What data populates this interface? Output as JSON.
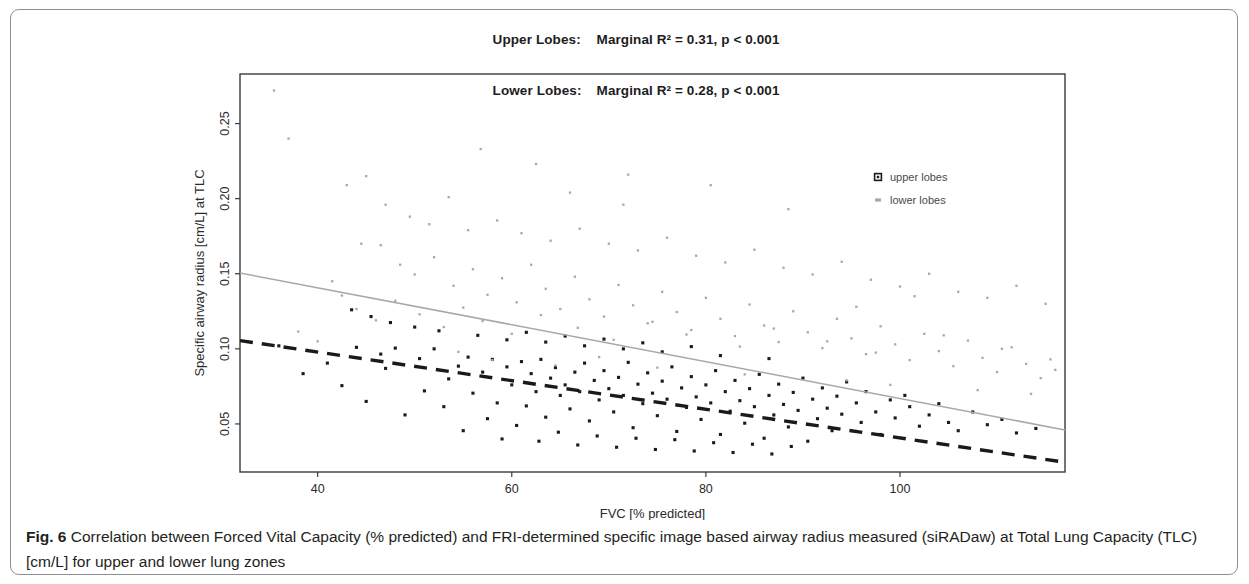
{
  "figure": {
    "label": "Fig. 6",
    "caption": " Correlation between Forced Vital Capacity (% predicted) and FRI-determined specific image based airway radius measured (siRADaw) at Total Lung Capacity (TLC) [cm/L] for upper and lower lung zones"
  },
  "title": {
    "line1_label": "Upper Lobes:",
    "line1_value": "Marginal R² = 0.31, p < 0.001",
    "line2_label": "Lower Lobes:",
    "line2_value": "Marginal R² = 0.28, p < 0.001"
  },
  "colors": {
    "upper_lobes": "#1a1a1a",
    "lower_lobes": "#a8a8a8",
    "axis": "#3a3a3a",
    "frame": "#8b8f93"
  },
  "chart_data": {
    "type": "scatter",
    "xlabel": "FVC [% predicted]",
    "ylabel": "Specific airway radius [cm/L] at TLC",
    "xlim": [
      32,
      117
    ],
    "ylim": [
      0.018,
      0.283
    ],
    "xticks": [
      40,
      60,
      80,
      100
    ],
    "yticks": [
      0.05,
      0.1,
      0.15,
      0.2,
      0.25
    ],
    "ytick_labels": [
      "0.05",
      "0.10",
      "0.15",
      "0.20",
      "0.25"
    ],
    "xtick_labels": [
      "40",
      "60",
      "80",
      "100"
    ],
    "grid": false,
    "legend_position": "top-right",
    "series": [
      {
        "name": "upper lobes",
        "marker": "square-open",
        "color": "#1a1a1a",
        "trendline": {
          "style": "dashed",
          "color": "#1a1a1a",
          "x_start": 32,
          "y_start": 0.1055,
          "x_end": 117,
          "y_end": 0.0245
        },
        "points": [
          [
            46.5,
            0.0965
          ],
          [
            48.0,
            0.1005
          ],
          [
            50.5,
            0.0935
          ],
          [
            52.0,
            0.1
          ],
          [
            53.5,
            0.08
          ],
          [
            54.5,
            0.0885
          ],
          [
            55.5,
            0.0945
          ],
          [
            56.0,
            0.0705
          ],
          [
            57.0,
            0.0845
          ],
          [
            58.0,
            0.093
          ],
          [
            58.5,
            0.064
          ],
          [
            59.5,
            0.088
          ],
          [
            60.0,
            0.076
          ],
          [
            61.0,
            0.0915
          ],
          [
            61.5,
            0.062
          ],
          [
            62.0,
            0.0835
          ],
          [
            62.5,
            0.0715
          ],
          [
            63.0,
            0.093
          ],
          [
            63.5,
            0.0545
          ],
          [
            64.0,
            0.0805
          ],
          [
            64.5,
            0.0875
          ],
          [
            65.0,
            0.069
          ],
          [
            65.5,
            0.076
          ],
          [
            66.0,
            0.06
          ],
          [
            66.5,
            0.0845
          ],
          [
            67.0,
            0.0715
          ],
          [
            67.5,
            0.0905
          ],
          [
            68.0,
            0.052
          ],
          [
            68.5,
            0.079
          ],
          [
            69.0,
            0.066
          ],
          [
            69.5,
            0.0855
          ],
          [
            70.0,
            0.0735
          ],
          [
            70.5,
            0.058
          ],
          [
            71.0,
            0.081
          ],
          [
            71.5,
            0.069
          ],
          [
            72.0,
            0.091
          ],
          [
            72.5,
            0.0475
          ],
          [
            73.0,
            0.0765
          ],
          [
            73.5,
            0.0635
          ],
          [
            74.0,
            0.084
          ],
          [
            74.5,
            0.0705
          ],
          [
            75.0,
            0.0555
          ],
          [
            75.5,
            0.0785
          ],
          [
            76.0,
            0.0665
          ],
          [
            76.5,
            0.088
          ],
          [
            77.0,
            0.045
          ],
          [
            77.5,
            0.074
          ],
          [
            78.0,
            0.061
          ],
          [
            78.5,
            0.0815
          ],
          [
            79.0,
            0.068
          ],
          [
            79.5,
            0.053
          ],
          [
            80.0,
            0.076
          ],
          [
            80.5,
            0.064
          ],
          [
            81.0,
            0.0855
          ],
          [
            81.5,
            0.043
          ],
          [
            82.0,
            0.0715
          ],
          [
            82.5,
            0.0585
          ],
          [
            83.0,
            0.079
          ],
          [
            83.5,
            0.0655
          ],
          [
            84.0,
            0.0505
          ],
          [
            84.5,
            0.0735
          ],
          [
            85.0,
            0.0615
          ],
          [
            85.5,
            0.083
          ],
          [
            86.0,
            0.0405
          ],
          [
            86.5,
            0.069
          ],
          [
            87.0,
            0.056
          ],
          [
            87.5,
            0.0765
          ],
          [
            88.0,
            0.063
          ],
          [
            88.5,
            0.048
          ],
          [
            89.0,
            0.071
          ],
          [
            89.5,
            0.059
          ],
          [
            90.0,
            0.0805
          ],
          [
            90.5,
            0.0385
          ],
          [
            91.0,
            0.0665
          ],
          [
            91.5,
            0.0535
          ],
          [
            92.0,
            0.074
          ],
          [
            92.5,
            0.0605
          ],
          [
            93.0,
            0.0455
          ],
          [
            93.5,
            0.0685
          ],
          [
            94.0,
            0.0565
          ],
          [
            94.5,
            0.078
          ],
          [
            95.5,
            0.064
          ],
          [
            96.0,
            0.051
          ],
          [
            96.5,
            0.0715
          ],
          [
            97.5,
            0.058
          ],
          [
            98.0,
            0.043
          ],
          [
            99.0,
            0.066
          ],
          [
            99.5,
            0.054
          ],
          [
            100.5,
            0.069
          ],
          [
            101.0,
            0.0615
          ],
          [
            102.0,
            0.0485
          ],
          [
            103.0,
            0.056
          ],
          [
            104.0,
            0.0635
          ],
          [
            105.0,
            0.051
          ],
          [
            106.0,
            0.0455
          ],
          [
            107.5,
            0.058
          ],
          [
            109.0,
            0.0495
          ],
          [
            110.5,
            0.053
          ],
          [
            112.0,
            0.044
          ],
          [
            114.0,
            0.047
          ],
          [
            36.0,
            0.102
          ],
          [
            38.5,
            0.0835
          ],
          [
            41.0,
            0.0905
          ],
          [
            42.5,
            0.0755
          ],
          [
            44.0,
            0.101
          ],
          [
            45.0,
            0.065
          ],
          [
            47.0,
            0.087
          ],
          [
            49.0,
            0.056
          ],
          [
            51.0,
            0.072
          ],
          [
            53.0,
            0.0615
          ],
          [
            55.0,
            0.0455
          ],
          [
            57.5,
            0.0535
          ],
          [
            59.0,
            0.04
          ],
          [
            60.5,
            0.049
          ],
          [
            62.8,
            0.0385
          ],
          [
            64.8,
            0.0445
          ],
          [
            66.8,
            0.036
          ],
          [
            68.8,
            0.042
          ],
          [
            70.8,
            0.0345
          ],
          [
            72.8,
            0.0405
          ],
          [
            74.8,
            0.033
          ],
          [
            76.8,
            0.0395
          ],
          [
            78.8,
            0.032
          ],
          [
            80.8,
            0.0375
          ],
          [
            82.8,
            0.031
          ],
          [
            84.8,
            0.0365
          ],
          [
            86.8,
            0.03
          ],
          [
            88.8,
            0.035
          ],
          [
            59.5,
            0.106
          ],
          [
            61.5,
            0.111
          ],
          [
            63.5,
            0.1045
          ],
          [
            65.5,
            0.1085
          ],
          [
            67.5,
            0.102
          ],
          [
            69.5,
            0.1065
          ],
          [
            71.5,
            0.1
          ],
          [
            73.5,
            0.104
          ],
          [
            75.5,
            0.098
          ],
          [
            78.5,
            0.1015
          ],
          [
            81.5,
            0.0955
          ],
          [
            86.5,
            0.0935
          ],
          [
            43.5,
            0.126
          ],
          [
            45.5,
            0.1215
          ],
          [
            47.5,
            0.1175
          ],
          [
            50.0,
            0.1145
          ],
          [
            52.5,
            0.112
          ],
          [
            56.5,
            0.109
          ]
        ]
      },
      {
        "name": "lower lobes",
        "marker": "square-small",
        "color": "#a8a8a8",
        "trendline": {
          "style": "solid",
          "color": "#a8a8a8",
          "x_start": 32,
          "y_start": 0.1505,
          "x_end": 117,
          "y_end": 0.046
        },
        "points": [
          [
            35.5,
            0.272
          ],
          [
            37.0,
            0.24
          ],
          [
            44.5,
            0.17
          ],
          [
            46.5,
            0.169
          ],
          [
            48.5,
            0.156
          ],
          [
            50.0,
            0.1495
          ],
          [
            52.0,
            0.161
          ],
          [
            54.0,
            0.142
          ],
          [
            56.0,
            0.153
          ],
          [
            57.5,
            0.136
          ],
          [
            59.0,
            0.147
          ],
          [
            60.5,
            0.131
          ],
          [
            62.0,
            0.156
          ],
          [
            63.5,
            0.14
          ],
          [
            65.0,
            0.1265
          ],
          [
            66.5,
            0.148
          ],
          [
            68.0,
            0.133
          ],
          [
            69.5,
            0.1215
          ],
          [
            71.0,
            0.1425
          ],
          [
            72.5,
            0.129
          ],
          [
            74.0,
            0.117
          ],
          [
            75.5,
            0.138
          ],
          [
            77.0,
            0.1245
          ],
          [
            78.5,
            0.1125
          ],
          [
            80.0,
            0.134
          ],
          [
            81.5,
            0.12
          ],
          [
            83.0,
            0.1085
          ],
          [
            84.5,
            0.1295
          ],
          [
            86.0,
            0.1155
          ],
          [
            87.5,
            0.1045
          ],
          [
            89.0,
            0.125
          ],
          [
            90.5,
            0.111
          ],
          [
            92.0,
            0.1005
          ],
          [
            93.5,
            0.12
          ],
          [
            95.0,
            0.107
          ],
          [
            96.5,
            0.0965
          ],
          [
            98.0,
            0.115
          ],
          [
            99.5,
            0.103
          ],
          [
            101.0,
            0.0925
          ],
          [
            102.5,
            0.11
          ],
          [
            104.0,
            0.0985
          ],
          [
            105.5,
            0.0885
          ],
          [
            107.0,
            0.1055
          ],
          [
            108.5,
            0.094
          ],
          [
            110.0,
            0.0845
          ],
          [
            111.5,
            0.101
          ],
          [
            113.0,
            0.09
          ],
          [
            114.5,
            0.0805
          ],
          [
            116.0,
            0.086
          ],
          [
            47.0,
            0.196
          ],
          [
            49.5,
            0.188
          ],
          [
            51.5,
            0.183
          ],
          [
            55.5,
            0.179
          ],
          [
            58.5,
            0.1855
          ],
          [
            61.0,
            0.177
          ],
          [
            64.0,
            0.172
          ],
          [
            67.0,
            0.18
          ],
          [
            70.0,
            0.17
          ],
          [
            73.0,
            0.1655
          ],
          [
            76.0,
            0.174
          ],
          [
            79.0,
            0.162
          ],
          [
            82.0,
            0.1575
          ],
          [
            85.0,
            0.166
          ],
          [
            88.0,
            0.154
          ],
          [
            91.0,
            0.1495
          ],
          [
            94.0,
            0.158
          ],
          [
            97.0,
            0.146
          ],
          [
            100.0,
            0.1415
          ],
          [
            103.0,
            0.15
          ],
          [
            106.0,
            0.138
          ],
          [
            109.0,
            0.134
          ],
          [
            112.0,
            0.142
          ],
          [
            115.0,
            0.13
          ],
          [
            43.0,
            0.209
          ],
          [
            45.0,
            0.215
          ],
          [
            53.5,
            0.201
          ],
          [
            62.5,
            0.223
          ],
          [
            66.0,
            0.204
          ],
          [
            71.5,
            0.196
          ],
          [
            80.5,
            0.209
          ],
          [
            88.5,
            0.193
          ],
          [
            41.5,
            0.145
          ],
          [
            42.5,
            0.1355
          ],
          [
            44.0,
            0.1265
          ],
          [
            46.0,
            0.119
          ],
          [
            48.0,
            0.132
          ],
          [
            50.5,
            0.123
          ],
          [
            53.0,
            0.1145
          ],
          [
            55.0,
            0.1275
          ],
          [
            57.0,
            0.1185
          ],
          [
            60.0,
            0.11
          ],
          [
            63.0,
            0.1225
          ],
          [
            66.8,
            0.114
          ],
          [
            70.5,
            0.106
          ],
          [
            74.5,
            0.118
          ],
          [
            78.0,
            0.1095
          ],
          [
            83.5,
            0.1015
          ],
          [
            87.0,
            0.1135
          ],
          [
            92.5,
            0.105
          ],
          [
            97.5,
            0.0975
          ],
          [
            104.5,
            0.109
          ],
          [
            110.5,
            0.1
          ],
          [
            115.5,
            0.093
          ],
          [
            38.0,
            0.1115
          ],
          [
            40.0,
            0.105
          ],
          [
            54.5,
            0.098
          ],
          [
            58.0,
            0.0925
          ],
          [
            64.5,
            0.089
          ],
          [
            69.0,
            0.0945
          ],
          [
            75.0,
            0.0875
          ],
          [
            84.0,
            0.083
          ],
          [
            94.5,
            0.079
          ],
          [
            99.0,
            0.076
          ],
          [
            108.0,
            0.0725
          ],
          [
            113.5,
            0.07
          ],
          [
            56.8,
            0.233
          ],
          [
            72.0,
            0.216
          ],
          [
            95.5,
            0.128
          ],
          [
            101.5,
            0.135
          ]
        ]
      }
    ]
  },
  "legend": {
    "items": [
      {
        "label": "upper lobes",
        "marker": "square-open",
        "color": "#1a1a1a"
      },
      {
        "label": "lower lobes",
        "marker": "square-small",
        "color": "#a8a8a8"
      }
    ]
  }
}
